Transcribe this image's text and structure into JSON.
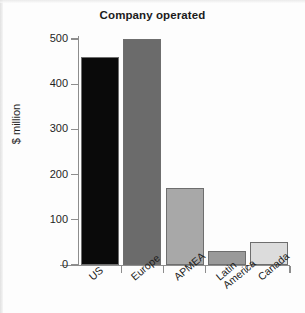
{
  "chart_data": {
    "type": "bar",
    "title": "Company operated",
    "xlabel": "",
    "ylabel": "$ million",
    "categories": [
      "US",
      "Europe",
      "APMEA",
      "Latin\nAmerica",
      "Canada"
    ],
    "values": [
      460,
      500,
      170,
      30,
      50
    ],
    "ylim": [
      0,
      500
    ],
    "ytick_labels": [
      "0",
      "100",
      "200",
      "300",
      "400",
      "500"
    ],
    "ytick_values": [
      0,
      100,
      200,
      300,
      400,
      500
    ],
    "grid": false,
    "legend": "none",
    "bar_colors": [
      "#0a0a0a",
      "#6b6b6b",
      "#a8a8a8",
      "#9a9a9a",
      "#dcdcdc"
    ],
    "bar_edge_color": "#6e6e6e",
    "axis_color": "#8d8d8d",
    "text_color": "#1b1b1b",
    "background": "#fdfdfd"
  }
}
